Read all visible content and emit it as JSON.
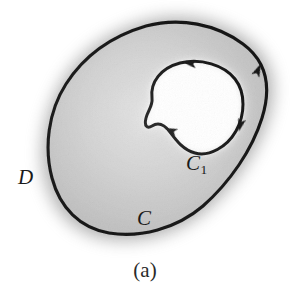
{
  "figure": {
    "caption": "(a)",
    "labels": {
      "region": "D",
      "outer_curve": "C",
      "inner_curve_base": "C",
      "inner_curve_subscript": "1"
    },
    "colors": {
      "curve_stroke": "#161616",
      "region_fill": "#c9c9c9",
      "hole_fill": "#ffffff",
      "halo": "#9a9a9a",
      "background": "#ffffff",
      "label_text": "#1a1a1a"
    },
    "geometry": {
      "outer_curve_points": "M 66,84 C 84,56 112,36 146,26 C 180,17 216,24 243,44 C 266,61 272,86 262,118 C 252,150 230,182 203,206 C 176,229 140,238 109,233 C 80,228 60,208 52,178 C 44,148 48,112 66,84 Z",
      "inner_curve_points": "M 152,98 C 150,82 161,68 180,63 C 201,58 224,65 235,79 C 246,93 245,115 236,131 C 227,147 209,157 195,153 C 183,150 176,140 170,132 C 164,124 158,122 152,126 C 147,129 144,126 146,118 C 148,110 153,106 152,98 Z",
      "arrows": [
        {
          "name": "outer-curve-arrow-upper-right",
          "x": 257,
          "y": 70,
          "angle": -72
        },
        {
          "name": "inner-curve-arrow-top",
          "x": 190,
          "y": 63,
          "angle": 190
        },
        {
          "name": "inner-curve-arrow-right",
          "x": 240,
          "y": 124,
          "angle": 100
        },
        {
          "name": "inner-curve-arrow-notch",
          "x": 171,
          "y": 131,
          "angle": 200
        }
      ]
    }
  }
}
